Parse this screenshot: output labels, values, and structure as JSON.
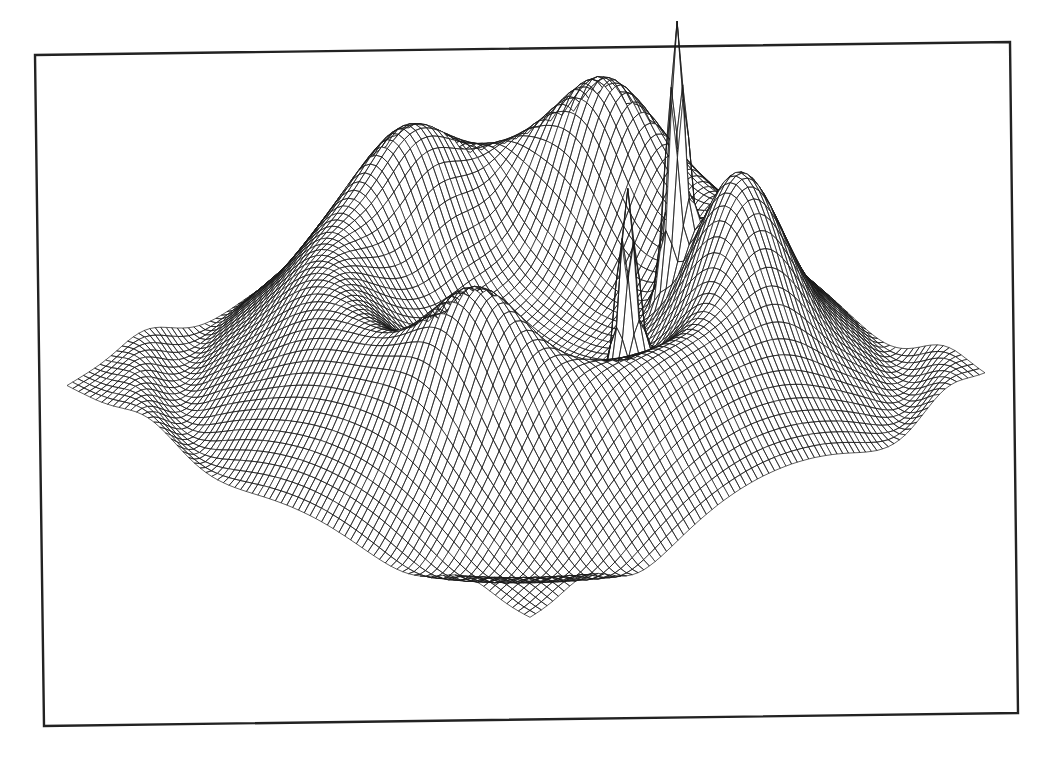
{
  "figure": {
    "description": "3D wireframe mesh surface plot, no axes or labels",
    "frame_color": "#222222",
    "mesh_color": "#1a1a1a",
    "background": "#ffffff"
  },
  "chart_data": {
    "type": "surface-wireframe",
    "title": "",
    "xlabel": "",
    "ylabel": "",
    "zlabel": "",
    "axes_visible": false,
    "grid": false,
    "legend": null,
    "frame": {
      "corners": [
        [
          35,
          55
        ],
        [
          1010,
          42
        ],
        [
          1018,
          713
        ],
        [
          44,
          726
        ]
      ]
    },
    "surface_corners_px": {
      "left": [
        67,
        388
      ],
      "top": [
        508,
        145
      ],
      "right": [
        985,
        377
      ],
      "bottom": [
        530,
        620
      ]
    },
    "mesh_resolution": 80,
    "features": [
      {
        "kind": "ring-plateau",
        "center": [
          0,
          0
        ],
        "radius": 0.48,
        "width": 0.16,
        "height": 0.55
      },
      {
        "kind": "inner-basin",
        "center": [
          0,
          0
        ],
        "radius": 0.32,
        "height": 0.15
      },
      {
        "kind": "outer-ripple",
        "radius": 0.78,
        "amplitude": 0.07
      },
      {
        "kind": "rim-bump",
        "angle_deg": 200,
        "height": 0.45
      },
      {
        "kind": "rim-bump",
        "angle_deg": 95,
        "height": 0.55
      },
      {
        "kind": "rim-bump",
        "angle_deg": 20,
        "height": 0.5
      },
      {
        "kind": "rim-bump",
        "angle_deg": 320,
        "height": 0.35
      },
      {
        "kind": "spike",
        "position": [
          -0.22,
          0.28
        ],
        "height": 1.05,
        "label": "left spike"
      },
      {
        "kind": "spike",
        "position": [
          0.08,
          0.42
        ],
        "height": 1.45,
        "label": "right spike (tallest)"
      }
    ],
    "peaks_px": [
      {
        "name": "spike-left",
        "tip": [
          450,
          227
        ]
      },
      {
        "name": "spike-right",
        "tip": [
          589,
          152
        ]
      }
    ]
  }
}
